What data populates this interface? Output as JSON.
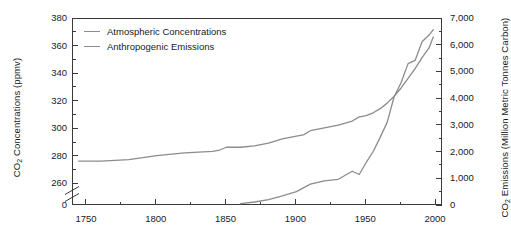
{
  "chart_data": {
    "type": "line",
    "title": "",
    "xlabel": "",
    "ylabel": "CO2 Concentrations (ppmv)",
    "ylabel_right": "CO2 Emissions (Million Metric Tonnes Carbon)",
    "grid": false,
    "legend_position": "top-left",
    "xlim": [
      1740,
      2005
    ],
    "xticks": [
      1750,
      1800,
      1850,
      1900,
      1950,
      2000
    ],
    "xticks_minor": [
      1775,
      1825,
      1875,
      1925,
      1975
    ],
    "ylim_left": [
      260,
      380
    ],
    "yticks_left": [
      260,
      280,
      300,
      320,
      340,
      360,
      380
    ],
    "yticks_left_minor": [
      270,
      290,
      310,
      330,
      350,
      370
    ],
    "y_axis_left_break": true,
    "y_axis_left_break_label": "0",
    "ylim_right": [
      0,
      7000
    ],
    "yticks_right": [
      0,
      1000,
      2000,
      3000,
      4000,
      5000,
      6000,
      7000
    ],
    "ytick_right_labels": [
      "0",
      "1,000",
      "2,000",
      "3,000",
      "4,000",
      "5,000",
      "6,000",
      "7,000"
    ],
    "yticks_right_minor": [
      500,
      1500,
      2500,
      3500,
      4500,
      5500,
      6500
    ],
    "series": [
      {
        "name": "Atmospheric Concentrations",
        "axis": "left",
        "color": "#8c8c8c",
        "units": "ppmv",
        "x": [
          1744,
          1760,
          1780,
          1800,
          1820,
          1840,
          1845,
          1850,
          1860,
          1870,
          1880,
          1890,
          1900,
          1905,
          1910,
          1920,
          1930,
          1940,
          1945,
          1950,
          1955,
          1960,
          1965,
          1970,
          1975,
          1980,
          1985,
          1990,
          1995,
          1998
        ],
        "values": [
          277,
          277,
          278,
          281,
          283,
          284,
          285,
          287,
          287,
          288,
          290,
          293,
          295,
          296,
          299,
          301,
          303,
          306,
          309,
          310,
          312,
          315,
          319,
          324,
          330,
          337,
          344,
          352,
          359,
          367
        ]
      },
      {
        "name": "Anthropogenic Emissions",
        "axis": "right",
        "color": "#8c8c8c",
        "units": "Million Metric Tonnes Carbon",
        "x": [
          1860,
          1870,
          1880,
          1890,
          1900,
          1910,
          1920,
          1930,
          1940,
          1945,
          1950,
          1955,
          1960,
          1965,
          1970,
          1975,
          1980,
          1985,
          1990,
          1995,
          1998
        ],
        "values": [
          90,
          150,
          240,
          380,
          540,
          820,
          940,
          1000,
          1300,
          1180,
          1630,
          2040,
          2570,
          3130,
          4090,
          4620,
          5330,
          5450,
          6150,
          6400,
          6600
        ]
      }
    ],
    "annotations": []
  },
  "legend": {
    "items": [
      {
        "label": "Atmospheric Concentrations",
        "color": "#8c8c8c"
      },
      {
        "label": "Anthropogenic Emissions",
        "color": "#8c8c8c"
      }
    ]
  },
  "axes": {
    "left_title_main": "CO",
    "left_title_sub": "2",
    "left_title_rest": " Concentrations (ppmv)",
    "right_title_main": "CO",
    "right_title_sub": "2",
    "right_title_rest": " Emissions (Million Metric Tonnes Carbon)"
  },
  "colors": {
    "line": "#8c8c8c",
    "axis": "#3a3a3a",
    "text": "#1a1a1a",
    "background": "#ffffff"
  }
}
